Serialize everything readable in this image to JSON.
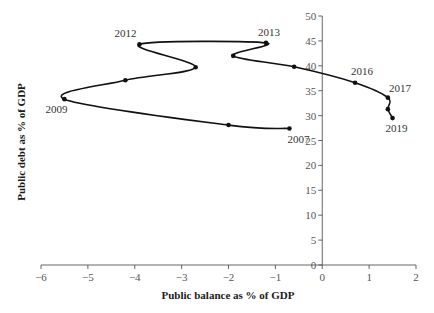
{
  "chart_data": {
    "type": "line",
    "title": "",
    "xlabel": "Public balance as % of GDP",
    "ylabel": "Public debt as % of GDP",
    "xlim": [
      -6,
      2
    ],
    "ylim": [
      0,
      50
    ],
    "xticks": [
      -6,
      -5,
      -4,
      -3,
      -2,
      -1,
      0,
      1,
      2
    ],
    "yticks": [
      0,
      5,
      10,
      15,
      20,
      25,
      30,
      35,
      40,
      45,
      50
    ],
    "xtick_labels": [
      "−6",
      "−5",
      "−4",
      "−3",
      "−2",
      "−1",
      "0",
      "1",
      "2"
    ],
    "ytick_labels": [
      "0",
      "5",
      "10",
      "15",
      "20",
      "25",
      "30",
      "35",
      "40",
      "45",
      "50"
    ],
    "grid": false,
    "legend": "none",
    "series": [
      {
        "name": "Public balance vs public debt",
        "points": [
          {
            "year": "2007",
            "x": -0.7,
            "y": 27.4,
            "label": "2007"
          },
          {
            "year": "2008",
            "x": -2.0,
            "y": 28.1,
            "label": ""
          },
          {
            "year": "2009",
            "x": -5.5,
            "y": 33.3,
            "label": "2009"
          },
          {
            "year": "2010",
            "x": -4.2,
            "y": 37.1,
            "label": ""
          },
          {
            "year": "2011",
            "x": -2.7,
            "y": 39.7,
            "label": ""
          },
          {
            "year": "2012",
            "x": -3.9,
            "y": 44.3,
            "label": "2012"
          },
          {
            "year": "2013",
            "x": -1.2,
            "y": 44.6,
            "label": "2013"
          },
          {
            "year": "2014",
            "x": -1.9,
            "y": 42.0,
            "label": ""
          },
          {
            "year": "2015",
            "x": -0.6,
            "y": 39.8,
            "label": ""
          },
          {
            "year": "2016",
            "x": 0.7,
            "y": 36.6,
            "label": "2016"
          },
          {
            "year": "2017",
            "x": 1.4,
            "y": 33.6,
            "label": "2017"
          },
          {
            "year": "2018",
            "x": 1.4,
            "y": 31.3,
            "label": ""
          },
          {
            "year": "2019",
            "x": 1.5,
            "y": 29.5,
            "label": "2019"
          }
        ]
      }
    ]
  }
}
